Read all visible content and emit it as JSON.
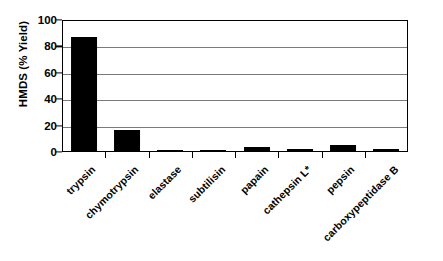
{
  "chart_data": {
    "type": "bar",
    "title": "",
    "xlabel": "",
    "ylabel": "HMDS (% Yield)",
    "categories": [
      "trypsin",
      "chymotrypsin",
      "elastase",
      "subtilisin",
      "papain",
      "cathepsin L*",
      "pepsin",
      "carboxypeptidase B"
    ],
    "values": [
      87,
      16.5,
      1.5,
      1.8,
      4,
      2,
      5.5,
      2.5
    ],
    "ylim": [
      0,
      100
    ],
    "ytick_labels": [
      "100",
      "80",
      "60",
      "40",
      "20",
      "0"
    ],
    "ytick_values": [
      100,
      80,
      60,
      40,
      20,
      0
    ],
    "ytick_step": 20,
    "grid": true,
    "grid_axis": "y",
    "legend": false,
    "bar_color": "#000000",
    "grid_color": "#7a7a7a",
    "axis_color": "#000000",
    "background_color": "#ffffff",
    "xlabel_rotation": -45
  }
}
